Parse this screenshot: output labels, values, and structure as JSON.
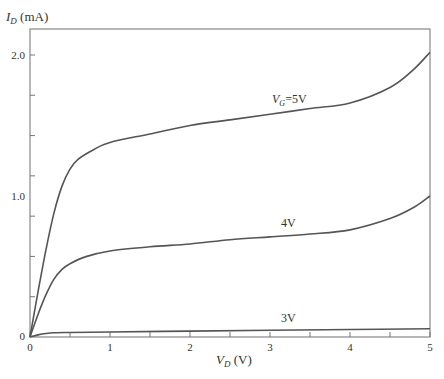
{
  "chart_data": {
    "type": "line",
    "title": "",
    "ylabel_main": "I",
    "ylabel_sub": "D",
    "ylabel_unit": " (mA)",
    "xlabel_main": "V",
    "xlabel_sub": "D",
    "xlabel_unit": " (V)",
    "xlim": [
      0,
      5
    ],
    "ylim": [
      0,
      2.2
    ],
    "x_ticks": [
      0,
      0.5,
      1,
      1.5,
      2,
      2.5,
      3,
      3.5,
      4,
      4.5,
      5
    ],
    "x_tick_labels": [
      "0",
      "1",
      "2",
      "3",
      "4",
      "5"
    ],
    "y_ticks": [
      0,
      0.3,
      0.6,
      0.9,
      1.0,
      1.3,
      1.6,
      2.0
    ],
    "y_tick_labels": [
      "0",
      "1.0",
      "2.0"
    ],
    "grid": false,
    "series": [
      {
        "name": "VG=5V",
        "label_main": "V",
        "label_sub": "G",
        "label_rest": "=5V",
        "x": [
          0,
          0.1,
          0.2,
          0.3,
          0.4,
          0.5,
          0.6,
          0.8,
          1.0,
          1.5,
          2.0,
          2.5,
          3.0,
          3.5,
          4.0,
          4.5,
          4.8,
          5.0
        ],
        "y": [
          0,
          0.32,
          0.62,
          0.88,
          1.07,
          1.19,
          1.26,
          1.33,
          1.38,
          1.44,
          1.5,
          1.54,
          1.58,
          1.62,
          1.66,
          1.77,
          1.9,
          2.02
        ]
      },
      {
        "name": "4V",
        "label_rest": "4V",
        "x": [
          0,
          0.1,
          0.2,
          0.3,
          0.4,
          0.5,
          0.7,
          1.0,
          1.5,
          2.0,
          2.5,
          3.0,
          3.5,
          4.0,
          4.5,
          4.8,
          5.0
        ],
        "y": [
          0,
          0.16,
          0.3,
          0.41,
          0.48,
          0.52,
          0.57,
          0.61,
          0.64,
          0.66,
          0.69,
          0.71,
          0.73,
          0.76,
          0.84,
          0.92,
          1.0
        ]
      },
      {
        "name": "3V",
        "label_rest": "3V",
        "x": [
          0,
          0.1,
          0.2,
          0.3,
          0.5,
          1.0,
          2.0,
          3.0,
          4.0,
          5.0
        ],
        "y": [
          0,
          0.015,
          0.025,
          0.03,
          0.032,
          0.035,
          0.042,
          0.048,
          0.053,
          0.058
        ]
      }
    ]
  }
}
